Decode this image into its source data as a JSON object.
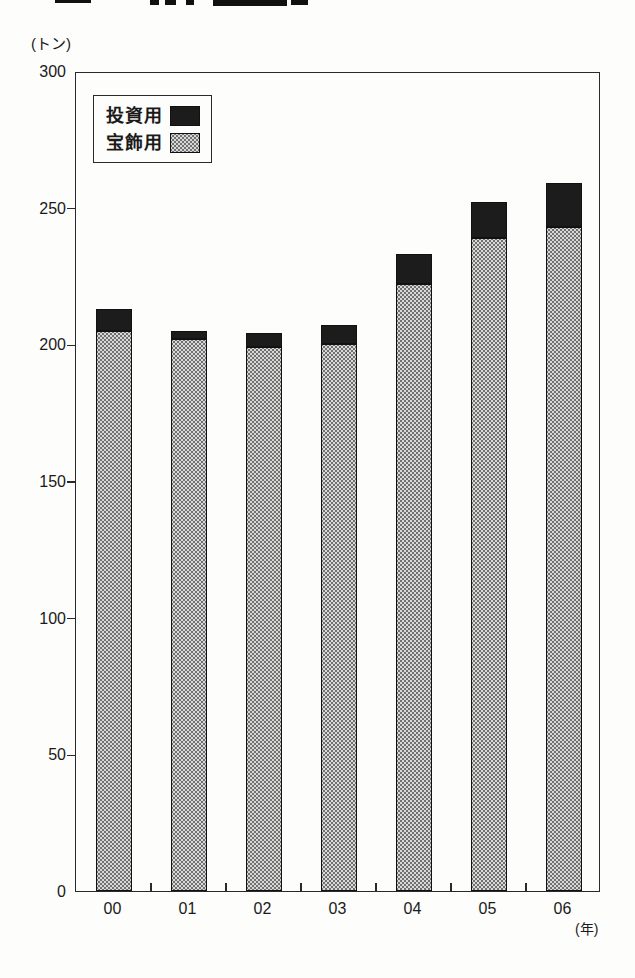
{
  "chart_data": {
    "type": "bar",
    "stacked": true,
    "title": "",
    "unit_label": "(トン)",
    "x_axis_unit_label": "(年)",
    "categories": [
      "00",
      "01",
      "02",
      "03",
      "04",
      "05",
      "06"
    ],
    "series": [
      {
        "name": "宝飾用",
        "style": "stipple",
        "values": [
          205,
          202,
          199,
          200,
          222,
          239,
          243
        ]
      },
      {
        "name": "投資用",
        "style": "dark",
        "values": [
          8,
          3,
          5,
          7,
          11,
          13,
          16
        ]
      }
    ],
    "ylim": [
      0,
      300
    ],
    "yticks": [
      0,
      50,
      100,
      150,
      200,
      250,
      300
    ],
    "grid": false,
    "legend_position": "top-left"
  },
  "legend": {
    "items": [
      {
        "label": "投資用",
        "swatch": "dark"
      },
      {
        "label": "宝飾用",
        "swatch": "stipple"
      }
    ]
  },
  "colors": {
    "bar_dark": "#1c1c1c",
    "bar_stipple_base": "#d8d8d8",
    "stipple_dot": "#6e6e6e",
    "frame": "#2a2a2a",
    "text": "#1a1a1a",
    "background": "#fdfdfc"
  }
}
